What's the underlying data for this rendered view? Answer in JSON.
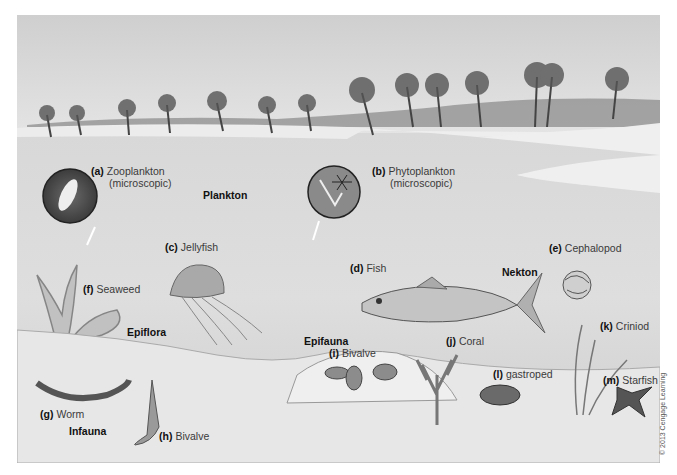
{
  "figure": {
    "zones": {
      "plankton": "Plankton",
      "nekton": "Nekton",
      "epiflora": "Epiflora",
      "epifauna": "Epifauna",
      "infauna": "Infauna"
    },
    "labels": [
      {
        "letter": "(a)",
        "text": "Zooplankton",
        "sub": "(microscopic)"
      },
      {
        "letter": "(b)",
        "text": "Phytoplankton",
        "sub": "(microscopic)"
      },
      {
        "letter": "(c)",
        "text": "Jellyfish"
      },
      {
        "letter": "(d)",
        "text": "Fish"
      },
      {
        "letter": "(e)",
        "text": "Cephalopod"
      },
      {
        "letter": "(f)",
        "text": "Seaweed"
      },
      {
        "letter": "(g)",
        "text": "Worm"
      },
      {
        "letter": "(h)",
        "text": "Bivalve"
      },
      {
        "letter": "(i)",
        "text": "Bivalve"
      },
      {
        "letter": "(j)",
        "text": "Coral"
      },
      {
        "letter": "(k)",
        "text": "Criniod"
      },
      {
        "letter": "(l)",
        "text": "gastroped"
      },
      {
        "letter": "(m)",
        "text": "Starfish"
      }
    ],
    "copyright": "© 2013 Cengage Learning",
    "colors": {
      "sky": "#d9d9d9",
      "beach": "#ececec",
      "water": "#d2d2d2",
      "sand": "#e6e6e6",
      "inset_circle": "#4a4a4a"
    }
  }
}
